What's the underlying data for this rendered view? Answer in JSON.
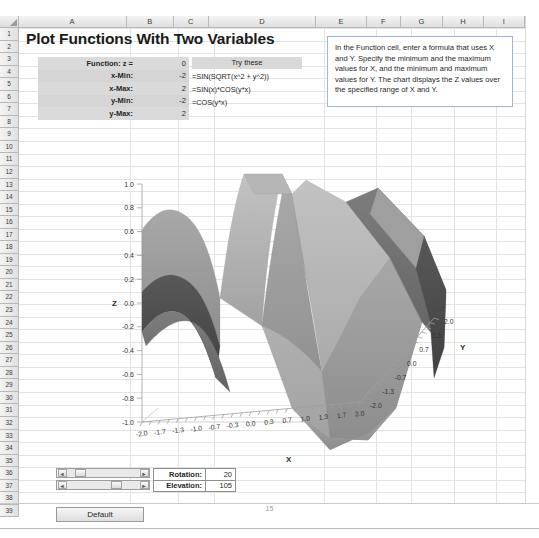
{
  "sheet": {
    "columns": [
      "A",
      "B",
      "C",
      "D",
      "E",
      "F",
      "G",
      "H",
      "I"
    ],
    "rows": [
      "1",
      "2",
      "3",
      "4",
      "5",
      "6",
      "7",
      "8",
      "9",
      "10",
      "11",
      "12",
      "13",
      "14",
      "15",
      "16",
      "17",
      "18",
      "19",
      "20",
      "21",
      "22",
      "23",
      "24",
      "25",
      "26",
      "27",
      "28",
      "29",
      "30",
      "31",
      "32",
      "33",
      "34",
      "35",
      "36",
      "37",
      "38",
      "39"
    ],
    "page_number": "15"
  },
  "title": "Plot Functions With Two Variables",
  "parameters": {
    "rows": [
      {
        "label": "Function: z =",
        "value": "0"
      },
      {
        "label": "x-Min:",
        "value": "-2"
      },
      {
        "label": "x-Max:",
        "value": "2"
      },
      {
        "label": "y-Min:",
        "value": "-2"
      },
      {
        "label": "y-Max:",
        "value": "2"
      }
    ]
  },
  "try_these": {
    "header": "Try these",
    "formulas": [
      "=SIN(SQRT(x^2 + y^2))",
      "=SIN(x)*COS(y*x)",
      "=COS(y*x)"
    ]
  },
  "note": {
    "text": "In the Function cell, enter a formula that uses X and Y. Specify the minimum and the maximum values for X, and the minimum and maximum values for Y. The chart displays the Z values over the specified range of X and Y.",
    "border_color": "#9fb8cf"
  },
  "controls": {
    "rotation_label": "Rotation:",
    "rotation_value": "20",
    "elevation_label": "Elevation:",
    "elevation_value": "105",
    "default_button": "Default",
    "scroll_left_arrow": "◄",
    "scroll_right_arrow": "►"
  },
  "chart_data": {
    "type": "surface",
    "title": "",
    "xlabel": "X",
    "ylabel": "Y",
    "zlabel": "Z",
    "grid": true,
    "legend": false,
    "function": "z = COS(y*x)",
    "xlim": [
      -2,
      2
    ],
    "ylim": [
      -2,
      2
    ],
    "zlim": [
      -1.0,
      1.0
    ],
    "x_ticks": [
      "-2.0",
      "-1.7",
      "-1.3",
      "-1.0",
      "-0.7",
      "-0.3",
      "0.0",
      "0.3",
      "0.7",
      "1.0",
      "1.3",
      "1.7",
      "2.0"
    ],
    "y_ticks": [
      "2.0",
      "1.3",
      "0.7",
      "0.0",
      "-0.7",
      "-1.3",
      "-2.0"
    ],
    "z_ticks": [
      "1.0",
      "0.8",
      "0.6",
      "0.4",
      "0.2",
      "0.0",
      "-0.2",
      "-0.4",
      "-0.6",
      "-0.8",
      "-1.0"
    ],
    "surface_colors": {
      "light": "#b9b9b9",
      "mid": "#9a9a9a",
      "dark": "#6e6e6e",
      "darkest": "#4a4a4a"
    },
    "rotation": 20,
    "elevation": 105
  }
}
